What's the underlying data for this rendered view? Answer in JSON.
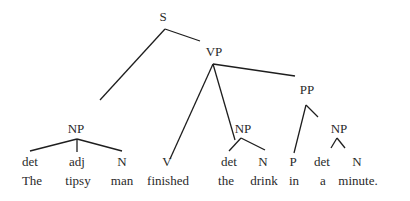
{
  "diagram": {
    "type": "syntax-tree",
    "nodes": {
      "S": {
        "label": "S",
        "x": 163,
        "y": 10
      },
      "VP": {
        "label": "VP",
        "x": 214,
        "y": 45
      },
      "PP": {
        "label": "PP",
        "x": 307,
        "y": 83
      },
      "NP_subject": {
        "label": "NP",
        "x": 76,
        "y": 122
      },
      "NP_object": {
        "label": "NP",
        "x": 243,
        "y": 122
      },
      "NP_pp": {
        "label": "NP",
        "x": 339,
        "y": 122
      }
    },
    "pos_tags": [
      {
        "label": "det",
        "x": 30,
        "y": 155
      },
      {
        "label": "adj",
        "x": 77,
        "y": 155
      },
      {
        "label": "N",
        "x": 122,
        "y": 155
      },
      {
        "label": "V",
        "x": 167,
        "y": 155
      },
      {
        "label": "det",
        "x": 229,
        "y": 155
      },
      {
        "label": "N",
        "x": 263,
        "y": 155
      },
      {
        "label": "P",
        "x": 293,
        "y": 155
      },
      {
        "label": "det",
        "x": 322,
        "y": 155
      },
      {
        "label": "N",
        "x": 357,
        "y": 155
      }
    ],
    "words": [
      {
        "label": "The",
        "x": 32,
        "y": 174
      },
      {
        "label": "tipsy",
        "x": 78,
        "y": 174
      },
      {
        "label": "man",
        "x": 122,
        "y": 174
      },
      {
        "label": "finished",
        "x": 168,
        "y": 174
      },
      {
        "label": "the",
        "x": 226,
        "y": 174
      },
      {
        "label": "drink",
        "x": 264,
        "y": 174
      },
      {
        "label": "in",
        "x": 294,
        "y": 174
      },
      {
        "label": "a",
        "x": 323,
        "y": 174
      },
      {
        "label": "minute.",
        "x": 358,
        "y": 174
      }
    ],
    "edges": [
      {
        "from": "S",
        "to": "NP_subject",
        "x1": 165,
        "y1": 29,
        "x2": 100,
        "y2": 100
      },
      {
        "from": "S",
        "to": "VP",
        "x1": 165,
        "y1": 29,
        "x2": 200,
        "y2": 41
      },
      {
        "from": "VP",
        "to": "V",
        "x1": 213,
        "y1": 64,
        "x2": 170,
        "y2": 159
      },
      {
        "from": "VP",
        "to": "NP_object",
        "x1": 213,
        "y1": 64,
        "x2": 235,
        "y2": 140
      },
      {
        "from": "VP",
        "to": "PP",
        "x1": 213,
        "y1": 64,
        "x2": 295,
        "y2": 76
      },
      {
        "from": "PP",
        "to": "P",
        "x1": 306,
        "y1": 105,
        "x2": 294,
        "y2": 153
      },
      {
        "from": "PP",
        "to": "NP_pp",
        "x1": 306,
        "y1": 105,
        "x2": 318,
        "y2": 117
      },
      {
        "from": "NP_subject",
        "to": "det",
        "x1": 77,
        "y1": 139,
        "x2": 30,
        "y2": 151
      },
      {
        "from": "NP_subject",
        "to": "adj",
        "x1": 77,
        "y1": 139,
        "x2": 77,
        "y2": 152
      },
      {
        "from": "NP_subject",
        "to": "N",
        "x1": 77,
        "y1": 139,
        "x2": 122,
        "y2": 151
      },
      {
        "from": "NP_object",
        "to": "det",
        "x1": 241,
        "y1": 138,
        "x2": 229,
        "y2": 151
      },
      {
        "from": "NP_object",
        "to": "N",
        "x1": 241,
        "y1": 138,
        "x2": 265,
        "y2": 150
      },
      {
        "from": "NP_pp",
        "to": "det",
        "x1": 337,
        "y1": 138,
        "x2": 331,
        "y2": 148
      },
      {
        "from": "NP_pp",
        "to": "N",
        "x1": 337,
        "y1": 138,
        "x2": 345,
        "y2": 148
      }
    ]
  }
}
